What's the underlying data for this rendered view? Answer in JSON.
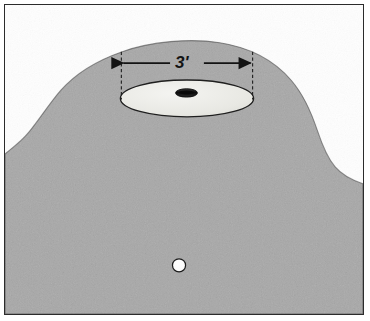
{
  "figure": {
    "kind": "technical-illustration",
    "frame": {
      "border_color": "#2b2b2b",
      "background_color": "#ffffff"
    }
  },
  "dimension": {
    "label": "3'",
    "value": 3,
    "unit": "feet",
    "unit_symbol": "'",
    "orientation": "horizontal",
    "arrow_color": "#131313",
    "extension_line_style": "dashed"
  },
  "scene": {
    "green": {
      "name": "putting-green",
      "fill_color": "#a9a9a9",
      "description": "mounded green surface"
    },
    "fringe": {
      "name": "stippled-rough",
      "fill_color": "#1a1a1a",
      "description": "stippled rough / fringe texture around green edge"
    },
    "cup_circle": {
      "name": "three-foot-circle",
      "fill_color": "#e9e9e4",
      "stroke_color": "#1f1f1f",
      "description": "light ellipse marking the 3 foot radius area around the hole"
    },
    "hole": {
      "name": "golf-hole",
      "fill_color": "#111111",
      "description": "the cup"
    },
    "ball": {
      "name": "golf-ball",
      "fill_color": "#ffffff",
      "stroke_color": "#1c1c1c",
      "description": "golf ball resting on the green"
    }
  }
}
